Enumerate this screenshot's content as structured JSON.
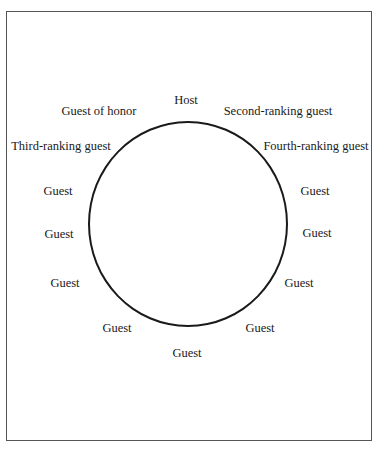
{
  "diagram": {
    "type": "seating-arrangement",
    "shape": "round-table",
    "seats": [
      {
        "label": "Host",
        "x": 186,
        "y": 100
      },
      {
        "label": "Guest of honor",
        "x": 99,
        "y": 111
      },
      {
        "label": "Second-ranking guest",
        "x": 278,
        "y": 111
      },
      {
        "label": "Third-ranking guest",
        "x": 61,
        "y": 146
      },
      {
        "label": "Fourth-ranking guest",
        "x": 316,
        "y": 146
      },
      {
        "label": "Guest",
        "x": 58,
        "y": 191
      },
      {
        "label": "Guest",
        "x": 315,
        "y": 191
      },
      {
        "label": "Guest",
        "x": 59,
        "y": 234
      },
      {
        "label": "Guest",
        "x": 317,
        "y": 233
      },
      {
        "label": "Guest",
        "x": 65,
        "y": 283
      },
      {
        "label": "Guest",
        "x": 299,
        "y": 283
      },
      {
        "label": "Guest",
        "x": 117,
        "y": 328
      },
      {
        "label": "Guest",
        "x": 260,
        "y": 328
      },
      {
        "label": "Guest",
        "x": 187,
        "y": 353
      }
    ]
  }
}
